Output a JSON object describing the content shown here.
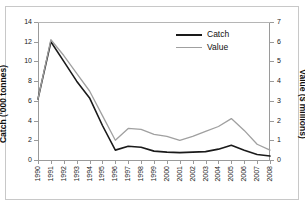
{
  "chart_data": {
    "type": "line",
    "title": "",
    "xlabel": "",
    "ylabel": "Catch ('000 tonnes)",
    "y2label": "Value ($ millions)",
    "grid": false,
    "legend_position": "top-center-right",
    "x": [
      1990,
      1991,
      1992,
      1993,
      1994,
      1995,
      1996,
      1997,
      1998,
      1999,
      2000,
      2001,
      2002,
      2003,
      2004,
      2005,
      2006,
      2007,
      2008
    ],
    "xtick_labels": [
      "1990",
      "1991",
      "1992",
      "1993",
      "1994",
      "1995",
      "1996",
      "1997",
      "1998",
      "1999",
      "2000",
      "2001",
      "2002",
      "2003",
      "2004",
      "2005",
      "2006",
      "2007",
      "2008"
    ],
    "ylim": [
      0,
      14
    ],
    "ytick_labels": [
      "0",
      "2",
      "4",
      "6",
      "8",
      "10",
      "12",
      "14"
    ],
    "ytick_values": [
      0,
      2,
      4,
      6,
      8,
      10,
      12,
      14
    ],
    "y2lim": [
      0,
      7
    ],
    "y2tick_labels": [
      "0",
      "1",
      "2",
      "3",
      "4",
      "5",
      "6",
      "7"
    ],
    "y2tick_values": [
      0,
      1,
      2,
      3,
      4,
      5,
      6,
      7
    ],
    "series": [
      {
        "name": "Catch",
        "axis": "left",
        "units": "'000 tonnes",
        "color": "#1a1a1a",
        "values": [
          6.2,
          12.0,
          10.0,
          8.0,
          6.3,
          3.5,
          1.0,
          1.4,
          1.3,
          0.9,
          0.8,
          0.75,
          0.8,
          0.85,
          1.1,
          1.5,
          1.0,
          0.55,
          0.4
        ]
      },
      {
        "name": "Value",
        "axis": "right",
        "units": "$ millions",
        "color": "#a0a0a0",
        "values": [
          3.1,
          6.1,
          5.3,
          4.4,
          3.5,
          2.25,
          1.0,
          1.6,
          1.55,
          1.3,
          1.2,
          1.0,
          1.2,
          1.45,
          1.7,
          2.1,
          1.5,
          0.8,
          0.5
        ]
      }
    ]
  },
  "legend": {
    "items": [
      {
        "label": "Catch",
        "color": "#1a1a1a"
      },
      {
        "label": "Value",
        "color": "#a0a0a0"
      }
    ]
  }
}
